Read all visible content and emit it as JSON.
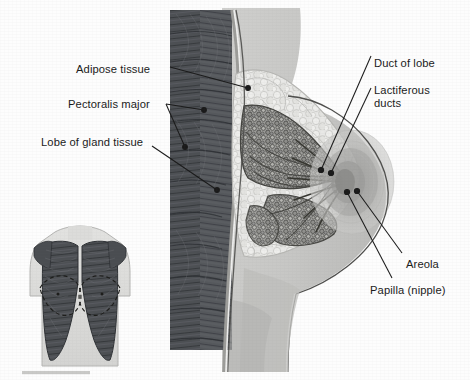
{
  "figure": {
    "background_color": "#fdfdfd",
    "ink_color": "#1a1a1a"
  },
  "labels": {
    "left": [
      {
        "id": "adipose-tissue",
        "text": "Adipose tissue",
        "x": 76,
        "y": 63
      },
      {
        "id": "pectoralis-major",
        "text": "Pectoralis major",
        "x": 68,
        "y": 98
      },
      {
        "id": "lobe-of-gland-tissue",
        "text": "Lobe of gland tissue",
        "x": 41,
        "y": 136
      }
    ],
    "right": [
      {
        "id": "duct-of-lobe",
        "text": "Duct of lobe",
        "x": 374,
        "y": 57
      },
      {
        "id": "lactiferous-ducts",
        "text": "Lactiferous\nducts",
        "x": 374,
        "y": 84
      },
      {
        "id": "areola",
        "text": "Areola",
        "x": 406,
        "y": 258
      },
      {
        "id": "papilla-nipple",
        "text": "Papilla (nipple)",
        "x": 370,
        "y": 284
      }
    ]
  },
  "structures": {
    "pectoralis_major": {
      "name": "Pectoralis major muscle",
      "fill": "#55585c",
      "striation_color": "#32353a"
    },
    "adipose_tissue": {
      "name": "Adipose tissue",
      "fill": "#e6e6e4",
      "outline": "#b9b9b6"
    },
    "gland_lobes": {
      "name": "Lobe of gland tissue",
      "fill": "#9a9a98",
      "outline": "#4a4a48"
    },
    "skin": {
      "name": "Skin / breast contour",
      "fill": "#c9c9c7",
      "outline": "#5a5a58"
    },
    "areola": {
      "name": "Areola",
      "fill": "#a8a8a6"
    },
    "papilla": {
      "name": "Papilla (nipple)",
      "fill": "#8d8d8b"
    },
    "lactiferous_ducts": {
      "name": "Lactiferous ducts",
      "stroke": "#3a3a38"
    },
    "torso_inset": {
      "name": "Anterior torso inset",
      "body_fill": "#dedede",
      "muscle_fill": "#55585c"
    }
  },
  "leaders": {
    "stroke": "#1a1a1a",
    "dot_radius": 2.4,
    "lines": [
      {
        "id": "leader-adipose",
        "from": [
          170,
          67
        ],
        "to": [
          248,
          88
        ]
      },
      {
        "id": "leader-pectoralis-a",
        "from": [
          166,
          104
        ],
        "to": [
          204,
          110
        ]
      },
      {
        "id": "leader-pectoralis-b",
        "from": [
          166,
          104
        ],
        "to": [
          185,
          147
        ]
      },
      {
        "id": "leader-lobe",
        "from": [
          152,
          146
        ],
        "to": [
          217,
          190
        ]
      },
      {
        "id": "leader-duct",
        "from": [
          371,
          56
        ],
        "to": [
          321,
          170
        ]
      },
      {
        "id": "leader-lactiferous",
        "from": [
          371,
          88
        ],
        "to": [
          330,
          173
        ]
      },
      {
        "id": "leader-areola",
        "from": [
          402,
          253
        ],
        "to": [
          357,
          191
        ]
      },
      {
        "id": "leader-papilla",
        "from": [
          392,
          278
        ],
        "to": [
          347,
          192
        ]
      }
    ]
  },
  "inset": {
    "name": "anterior-torso-pectoralis-inset",
    "caption": "",
    "bounds": [
      18,
      228,
      118,
      138
    ]
  }
}
